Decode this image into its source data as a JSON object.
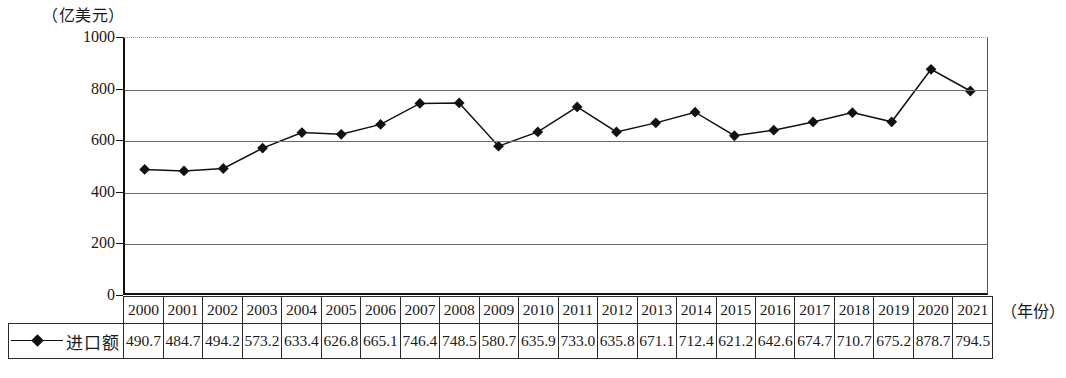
{
  "chart_data": {
    "type": "line",
    "title": "",
    "subtitle": "",
    "xlabel": "（年份）",
    "ylabel": "（亿美元）",
    "ylim": [
      0,
      1000
    ],
    "yticks": [
      0,
      200,
      400,
      600,
      800,
      1000
    ],
    "grid": true,
    "legend_position": "bottom-left-table",
    "marker": "diamond",
    "categories": [
      "2000",
      "2001",
      "2002",
      "2003",
      "2004",
      "2005",
      "2006",
      "2007",
      "2008",
      "2009",
      "2010",
      "2011",
      "2012",
      "2013",
      "2014",
      "2015",
      "2016",
      "2017",
      "2018",
      "2019",
      "2020",
      "2021"
    ],
    "series": [
      {
        "name": "进口额",
        "values": [
          490.7,
          484.7,
          494.2,
          573.2,
          633.4,
          626.8,
          665.1,
          746.4,
          748.5,
          580.7,
          635.9,
          733.0,
          635.8,
          671.1,
          712.4,
          621.2,
          642.6,
          674.7,
          710.7,
          675.2,
          878.7,
          794.5
        ]
      }
    ],
    "values_display": [
      "490.7",
      "484.7",
      "494.2",
      "573.2",
      "633.4",
      "626.8",
      "665.1",
      "746.4",
      "748.5",
      "580.7",
      "635.9",
      "733.0",
      "635.8",
      "671.1",
      "712.4",
      "621.2",
      "642.6",
      "674.7",
      "710.7",
      "675.2",
      "878.7",
      "794.5"
    ],
    "ytick_labels": [
      "0",
      "200",
      "400",
      "600",
      "800",
      "1000"
    ],
    "colors": {
      "line": "#111111",
      "marker": "#111111",
      "grid": "#6b6b6b",
      "axis": "#111111",
      "background": "#ffffff"
    }
  },
  "legend": {
    "label": "进口额"
  },
  "axes": {
    "y_unit_caption": "（亿美元）",
    "x_unit_caption": "（年份）"
  }
}
